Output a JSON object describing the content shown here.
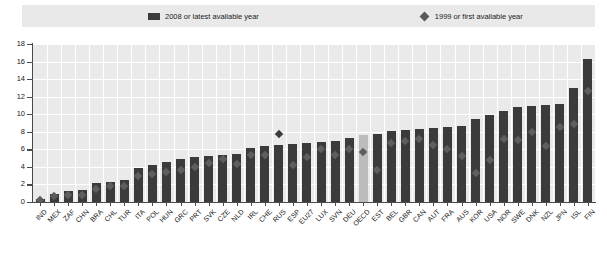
{
  "legend": {
    "bar_label": "2008 or latest available year",
    "diamond_label": "1999 or first available year",
    "bar_icon": "square-swatch-icon",
    "diamond_icon": "diamond-swatch-icon"
  },
  "colors": {
    "bar": "#3b3b3b",
    "bar_highlight": "#bcbcbc",
    "marker": "#5e5e5e",
    "plot_background": "#eaeaea",
    "legend_background": "#e9e9e9",
    "gridline": "#ffffff",
    "axis": "#4a4a4a"
  },
  "chart_data": {
    "type": "bar",
    "title": "",
    "xlabel": "",
    "ylabel": "",
    "ylim": [
      0,
      18
    ],
    "yticks": [
      0,
      2,
      4,
      6,
      8,
      10,
      12,
      14,
      16,
      18
    ],
    "grid": true,
    "legend_position": "top",
    "highlight_category": "OECD",
    "categories": [
      "IND",
      "MEX",
      "ZAF",
      "CHN",
      "BRA",
      "CHL",
      "TUR",
      "ITA",
      "POL",
      "HUN",
      "GRC",
      "PRT",
      "SVK",
      "CZE",
      "NLD",
      "IRL",
      "CHE",
      "RUS",
      "ESP",
      "EU27",
      "LUX",
      "SVN",
      "DEU",
      "OECD",
      "EST",
      "BEL",
      "GBR",
      "CAN",
      "AUT",
      "FRA",
      "AUS",
      "KOR",
      "USA",
      "NOR",
      "SWE",
      "DNK",
      "NZL",
      "JPN",
      "ISL",
      "FIN"
    ],
    "series": [
      {
        "name": "2008 or latest available year",
        "type": "bar",
        "values": [
          0.4,
          0.9,
          1.2,
          1.4,
          2.2,
          2.3,
          2.5,
          3.9,
          4.2,
          4.6,
          4.9,
          5.1,
          5.2,
          5.4,
          5.5,
          6.1,
          6.4,
          6.5,
          6.6,
          6.7,
          6.8,
          6.9,
          7.3,
          7.6,
          7.8,
          8.1,
          8.2,
          8.3,
          8.4,
          8.5,
          8.7,
          9.5,
          9.9,
          10.4,
          10.8,
          10.9,
          11.0,
          11.2,
          13.0,
          16.3
        ]
      },
      {
        "name": "1999 or first available year",
        "type": "scatter",
        "marker": "diamond",
        "values": [
          0.2,
          0.7,
          0.8,
          0.8,
          1.5,
          1.8,
          1.8,
          3.0,
          3.2,
          3.4,
          3.7,
          4.0,
          4.4,
          4.9,
          4.3,
          5.3,
          5.4,
          7.8,
          4.2,
          5.1,
          6.0,
          5.4,
          6.0,
          5.7,
          3.6,
          6.7,
          6.9,
          7.2,
          6.5,
          6.0,
          5.2,
          3.3,
          4.8,
          7.2,
          7.1,
          8.0,
          6.4,
          8.6,
          8.9,
          12.6
        ]
      }
    ]
  }
}
